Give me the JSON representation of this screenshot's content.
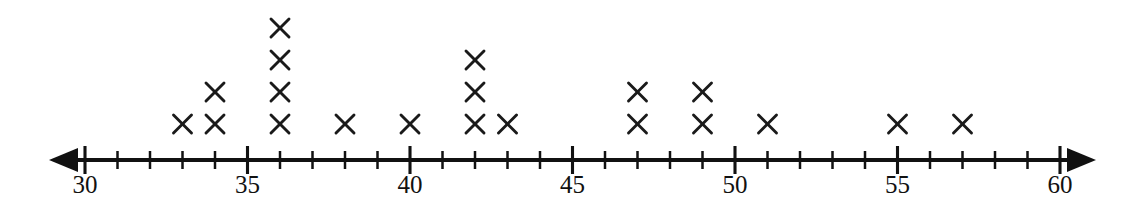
{
  "chart_data": {
    "type": "dotplot",
    "title": "",
    "xlabel": "",
    "ylabel": "",
    "marker": "x",
    "axis_min": 30,
    "axis_max": 60,
    "xlim": [
      30,
      60
    ],
    "tick_step": 1,
    "label_step": 5,
    "grid": false,
    "legend": null,
    "tick_labels": [
      "30",
      "35",
      "40",
      "45",
      "50",
      "55",
      "60"
    ],
    "labeled_ticks": [
      30,
      35,
      40,
      45,
      50,
      55,
      60
    ],
    "arrows": [
      "left",
      "right"
    ],
    "total_marks": 20,
    "categories": [
      30,
      31,
      32,
      33,
      34,
      35,
      36,
      37,
      38,
      39,
      40,
      41,
      42,
      43,
      44,
      45,
      46,
      47,
      48,
      49,
      50,
      51,
      52,
      53,
      54,
      55,
      56,
      57,
      58,
      59,
      60
    ],
    "values": [
      0,
      0,
      0,
      1,
      2,
      0,
      4,
      0,
      1,
      0,
      1,
      0,
      3,
      1,
      0,
      0,
      0,
      2,
      0,
      2,
      0,
      1,
      0,
      0,
      0,
      1,
      0,
      1,
      0,
      0,
      0
    ],
    "points": [
      {
        "value": 33,
        "count": 1
      },
      {
        "value": 34,
        "count": 2
      },
      {
        "value": 36,
        "count": 4
      },
      {
        "value": 38,
        "count": 1
      },
      {
        "value": 40,
        "count": 1
      },
      {
        "value": 42,
        "count": 3
      },
      {
        "value": 43,
        "count": 1
      },
      {
        "value": 47,
        "count": 2
      },
      {
        "value": 49,
        "count": 2
      },
      {
        "value": 51,
        "count": 1
      },
      {
        "value": 55,
        "count": 1
      },
      {
        "value": 57,
        "count": 1
      }
    ]
  },
  "style": {
    "ink_color": "#111111",
    "mark_color": "#1a1a1a",
    "background_color": "#ffffff"
  },
  "geometry": {
    "x_at_min": 85,
    "px_per_unit": 32.5,
    "axis_y": 160,
    "baseline_row_y": 124,
    "row_spacing": 32,
    "mark_half_size": 9,
    "tick_major_half": 14,
    "tick_minor_half": 9,
    "label_y": 193,
    "arrow_left_tip": 49,
    "arrow_right_tip": 1096
  }
}
